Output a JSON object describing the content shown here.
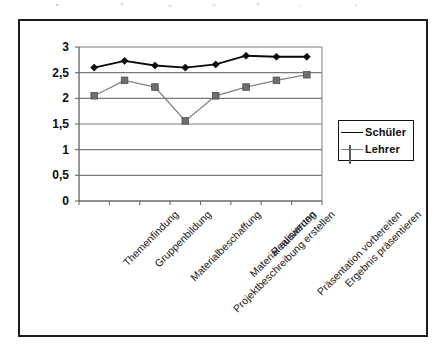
{
  "chart_data": {
    "type": "line",
    "title": "",
    "xlabel": "",
    "ylabel": "",
    "ylim": [
      0,
      3
    ],
    "ytick_step": 0.5,
    "ytick_labels": [
      "0",
      "0,5",
      "1",
      "1,5",
      "2",
      "2,5",
      "3"
    ],
    "ytick_values": [
      0,
      0.5,
      1,
      1.5,
      2,
      2.5,
      3
    ],
    "grid": "horizontal",
    "legend_position": "right",
    "categories": [
      "Themenfindung",
      "Gruppenbildung",
      "Materialbeschaffung",
      "Projektbeschreibung erstellen",
      "Material auswerten",
      "Realisierung",
      "Präsentation vorbereiten",
      "Ergebnis präsentieren"
    ],
    "series": [
      {
        "name": "Schüler",
        "marker": "diamond",
        "color": "#0a0a0a",
        "values": [
          2.6,
          2.73,
          2.64,
          2.6,
          2.66,
          2.83,
          2.81,
          2.81
        ]
      },
      {
        "name": "Lehrer",
        "marker": "square",
        "color": "#6e6e6e",
        "values": [
          2.05,
          2.35,
          2.22,
          1.56,
          2.05,
          2.22,
          2.35,
          2.46
        ]
      }
    ]
  },
  "legend": {
    "entries": [
      {
        "label": "Schüler"
      },
      {
        "label": "Lehrer"
      }
    ]
  },
  "colors": {
    "schueler_line": "#0a0a0a",
    "lehrer_line": "#808080",
    "axis": "#6b6b6b",
    "gridline": "#7a7a7a",
    "frame": "#1c1c1c",
    "background": "#ffffff"
  }
}
